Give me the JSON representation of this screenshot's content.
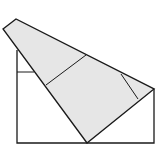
{
  "diagram": {
    "colors": {
      "stroke": "#1a1a1a",
      "fill": "#e6e6e6",
      "background": "#ffffff"
    },
    "rectangle": {
      "points": "17,50 17,143 154,143 154,89"
    },
    "flap": {
      "points": "3,29 16,19 154,89 87,143"
    },
    "lines": [
      {
        "name": "hidden-edge-horizontal",
        "x1": 17,
        "y1": 72,
        "x2": 34,
        "y2": 72
      },
      {
        "name": "crease-line-middle",
        "x1": 46,
        "y1": 85,
        "x2": 86,
        "y2": 55
      },
      {
        "name": "crease-line-right",
        "x1": 121,
        "y1": 74,
        "x2": 138,
        "y2": 99
      }
    ]
  }
}
